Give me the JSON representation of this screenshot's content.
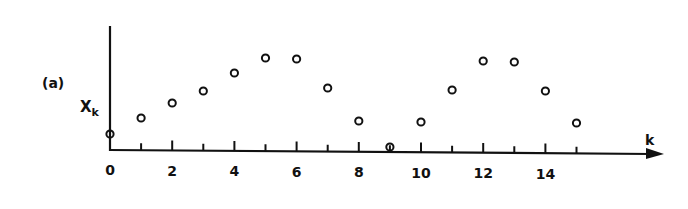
{
  "panel_label": "(a)",
  "chart_data": {
    "type": "scatter",
    "title": "",
    "panel_label": "(a)",
    "xlabel": "k",
    "ylabel": "X_k",
    "ylabel_main": "X",
    "ylabel_sub": "k",
    "x": [
      0,
      1,
      2,
      3,
      4,
      5,
      6,
      7,
      8,
      9,
      10,
      11,
      12,
      13,
      14,
      15
    ],
    "values": [
      16,
      32,
      47,
      59,
      77,
      92,
      91,
      62,
      29,
      3,
      28,
      60,
      89,
      88,
      59,
      27
    ],
    "xticks": [
      0,
      1,
      2,
      3,
      4,
      5,
      6,
      7,
      8,
      9,
      10,
      11,
      12,
      13,
      14,
      15
    ],
    "xtick_labels": [
      "0",
      "2",
      "4",
      "6",
      "8",
      "10",
      "12",
      "14"
    ],
    "xtick_label_positions": [
      0,
      2,
      4,
      6,
      8,
      10,
      12,
      14
    ],
    "xlim": [
      0,
      17.5
    ],
    "ylim": [
      0,
      100
    ],
    "y_tick_labels": [],
    "grid": false,
    "legend": null,
    "marker": "open-circle",
    "color": "#111111"
  }
}
